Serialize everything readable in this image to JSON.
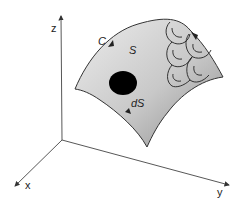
{
  "diagram": {
    "axes": {
      "x_label": "x",
      "y_label": "y",
      "z_label": "z"
    },
    "labels": {
      "curve": "C",
      "surface": "S",
      "element": "dS"
    },
    "colors": {
      "surface_light": "#e6e6e6",
      "surface_dark": "#9a9a9a",
      "element_fill": "#000000",
      "stroke": "#333333"
    },
    "circulation_cells": 5
  }
}
